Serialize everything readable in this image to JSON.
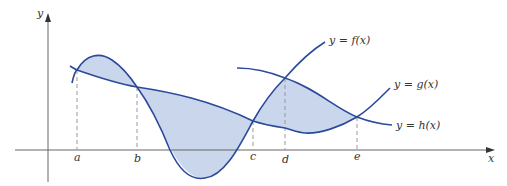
{
  "diagram": {
    "axes": {
      "x_label": "x",
      "y_label": "y"
    },
    "points": {
      "a": "a",
      "b": "b",
      "c": "c",
      "d": "d",
      "e": "e"
    },
    "curve_labels": {
      "f": "y = f(x)",
      "g": "y = g(x)",
      "h": "y = h(x)"
    },
    "colors": {
      "curve": "#2c4a9a",
      "fill": "#c9d6ec",
      "axis": "#666666",
      "guide": "#999999"
    }
  }
}
